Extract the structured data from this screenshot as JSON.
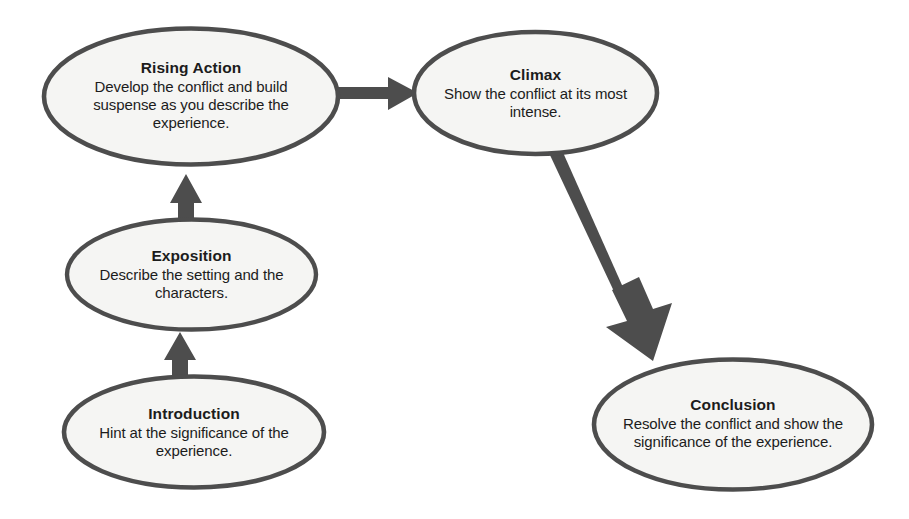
{
  "diagram": {
    "type": "flow-diagram",
    "background_color": "#ffffff",
    "shape_fill_color": "#f5f5f3",
    "shape_stroke_color": "#4d4d4d",
    "arrow_color": "#4d4d4d",
    "text_color": "#1c1c1c",
    "nodes": [
      {
        "id": "rising-action",
        "title": "Rising Action",
        "body": "Develop the conflict and build suspense as you describe the experience.",
        "shape": "ellipse"
      },
      {
        "id": "climax",
        "title": "Climax",
        "body": "Show the conflict at its most intense.",
        "shape": "ellipse"
      },
      {
        "id": "exposition",
        "title": "Exposition",
        "body": "Describe the setting and the characters.",
        "shape": "ellipse"
      },
      {
        "id": "introduction",
        "title": "Introduction",
        "body": "Hint at the significance of the experience.",
        "shape": "ellipse"
      },
      {
        "id": "conclusion",
        "title": "Conclusion",
        "body": "Resolve the conflict and show the significance of the experience.",
        "shape": "ellipse"
      }
    ],
    "connectors": [
      {
        "id": "introduction-to-exposition",
        "from": "introduction",
        "to": "exposition",
        "direction": "up"
      },
      {
        "id": "exposition-to-rising-action",
        "from": "exposition",
        "to": "rising-action",
        "direction": "up"
      },
      {
        "id": "rising-action-to-climax",
        "from": "rising-action",
        "to": "climax",
        "direction": "right"
      },
      {
        "id": "climax-to-conclusion",
        "from": "climax",
        "to": "conclusion",
        "direction": "down-right"
      }
    ]
  }
}
